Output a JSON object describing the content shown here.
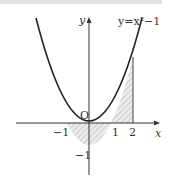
{
  "diagram": {
    "equation_label": "y=x²−1",
    "axis_x_label": "x",
    "axis_y_label": "y",
    "origin_label": "O",
    "tick_labels": {
      "neg_one_x": "−1",
      "one_x": "1",
      "two_x": "2",
      "neg_one_y": "−1"
    },
    "shaded_region": "area between y=x²−1 and x-axis from x=−1 to x=2",
    "colors": {
      "curve": "#222222",
      "axis": "#333333",
      "hatch": "#888888",
      "shade": "#e8e8e8"
    }
  }
}
